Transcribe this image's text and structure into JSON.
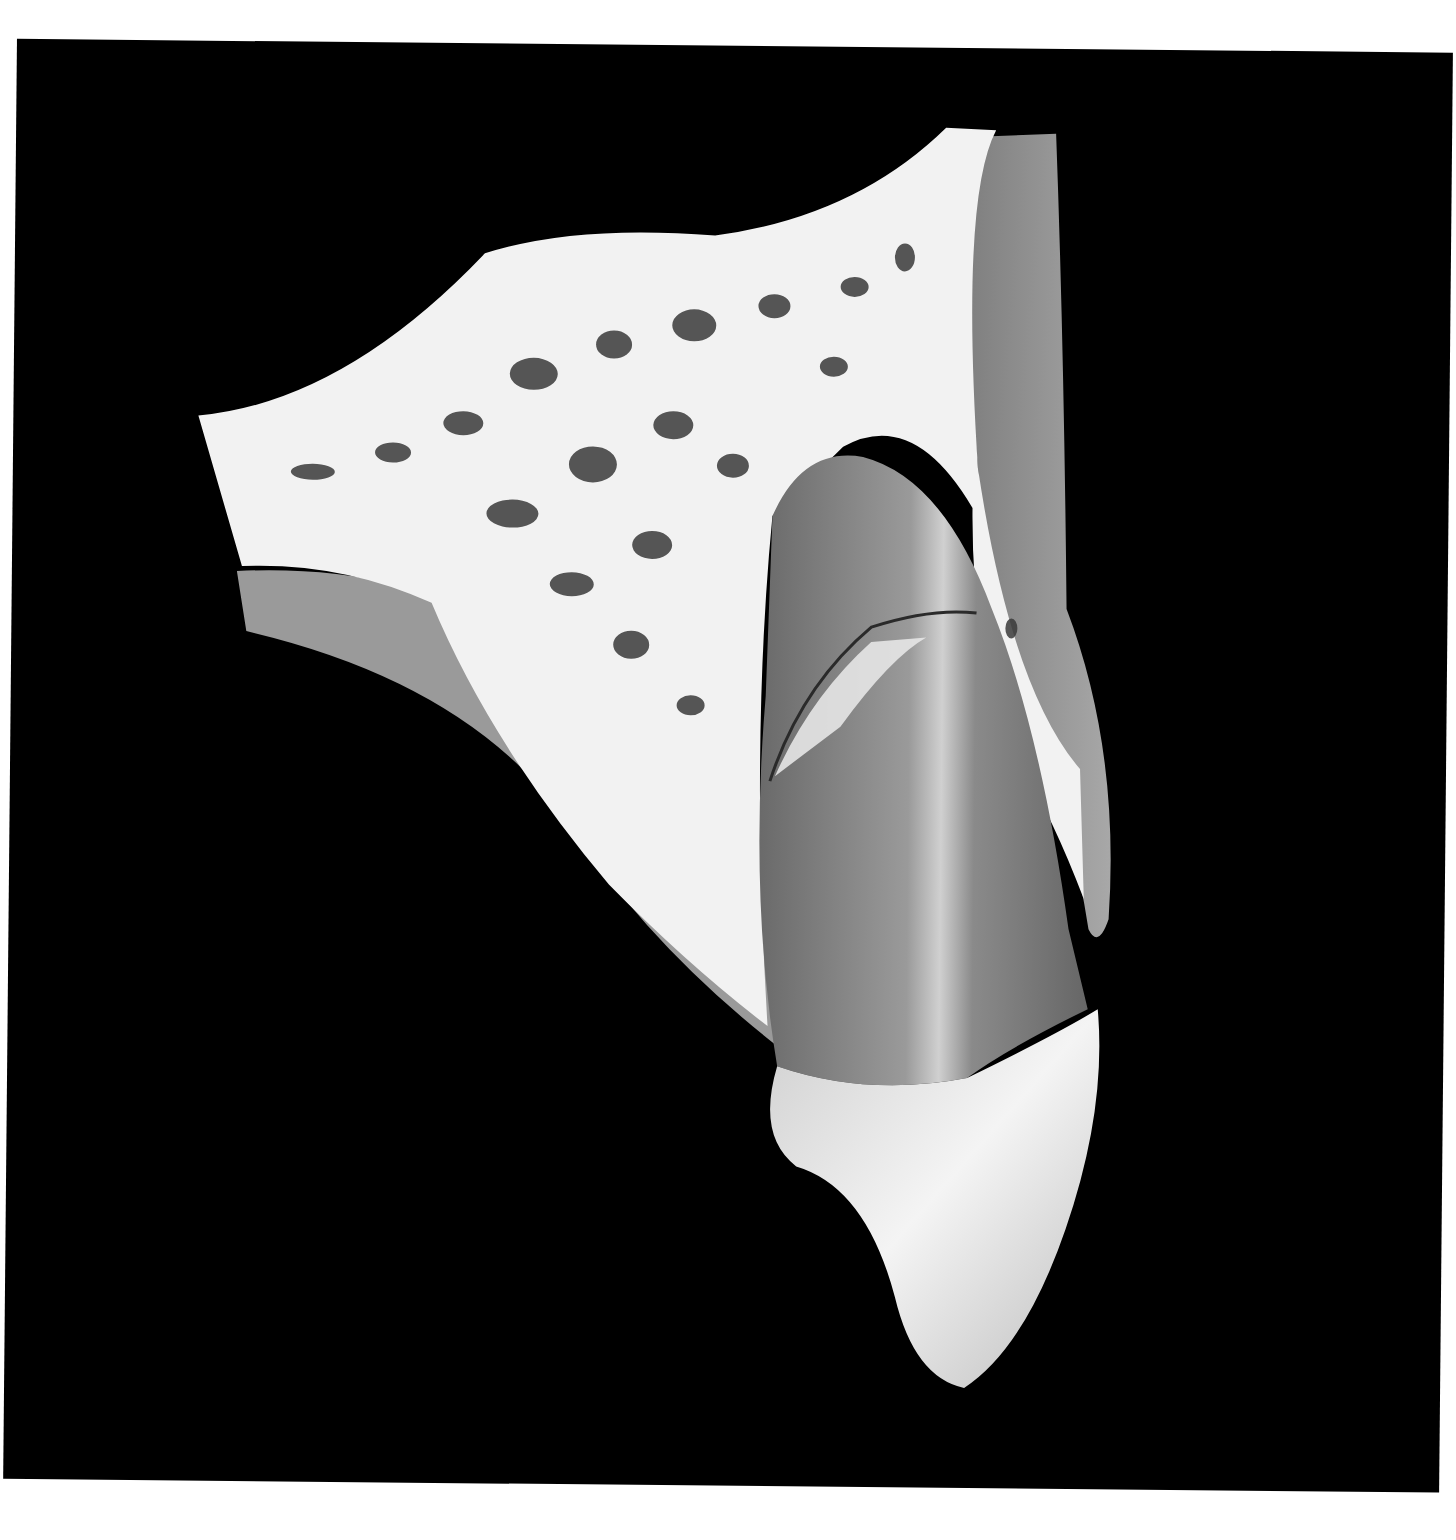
{
  "figure": {
    "style": "grayscale",
    "labels": []
  },
  "colors": {
    "background": "#000000",
    "page": "#ffffff",
    "bone_cortical": "#f2f2f2",
    "bone_pores": "#3a3a3a",
    "soft_tissue": "#8f8f8f",
    "root": "#7d7d7d",
    "crown": "#d8d8d8",
    "fracture_line": "#2a2a2a"
  }
}
